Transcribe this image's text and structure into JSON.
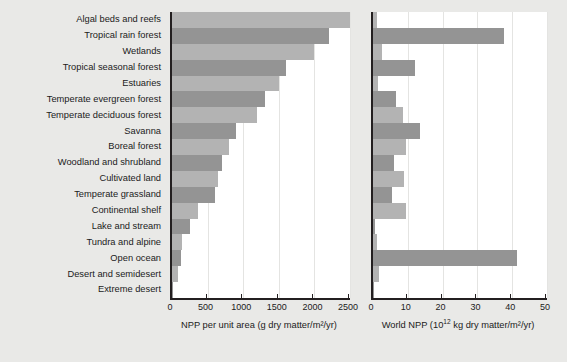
{
  "chart_data": {
    "type": "bar",
    "title": "",
    "orientation": "horizontal",
    "grid": true,
    "legend": "none",
    "categories": [
      "Algal beds and reefs",
      "Tropical rain forest",
      "Wetlands",
      "Tropical seasonal forest",
      "Estuaries",
      "Temperate evergreen forest",
      "Temperate deciduous forest",
      "Savanna",
      "Boreal forest",
      "Woodland and shrubland",
      "Cultivated land",
      "Temperate grassland",
      "Continental shelf",
      "Lake and stream",
      "Tundra and alpine",
      "Open ocean",
      "Desert and semidesert",
      "Extreme desert"
    ],
    "panels": [
      {
        "id": "npp-per-unit-area",
        "xlabel": "NPP per unit area (g dry matter/m²/yr)",
        "xlim": [
          0,
          2500
        ],
        "ticks": [
          0,
          500,
          1000,
          1500,
          2000,
          2500
        ],
        "ticklabels": [
          "0",
          "500",
          "1000",
          "1500",
          "2000",
          "2500"
        ],
        "values": [
          2500,
          2200,
          2000,
          1600,
          1500,
          1300,
          1200,
          900,
          800,
          700,
          650,
          600,
          360,
          250,
          140,
          125,
          90,
          3
        ]
      },
      {
        "id": "world-npp",
        "xlabel_html": "World NPP (10<sup>12</sup> kg dry matter/m²/yr)",
        "xlabel": "World NPP (1012 kg dry matter/m²/yr)",
        "xlim": [
          0,
          50
        ],
        "ticks": [
          0,
          10,
          20,
          30,
          40,
          50
        ],
        "ticklabels": [
          "0",
          "10",
          "20",
          "30",
          "40",
          "50"
        ],
        "values": [
          1.1,
          37.5,
          2.5,
          12.0,
          1.5,
          6.5,
          8.5,
          13.5,
          9.5,
          6.0,
          9.0,
          5.5,
          9.5,
          0.5,
          1.1,
          41.5,
          1.6,
          0.07
        ]
      }
    ],
    "colors": {
      "bar_light": "#b3b3b3",
      "bar_dark": "#949494",
      "axis": "#231f20",
      "page_background": "#e9e9e7",
      "plot_background": "#ffffff"
    }
  }
}
